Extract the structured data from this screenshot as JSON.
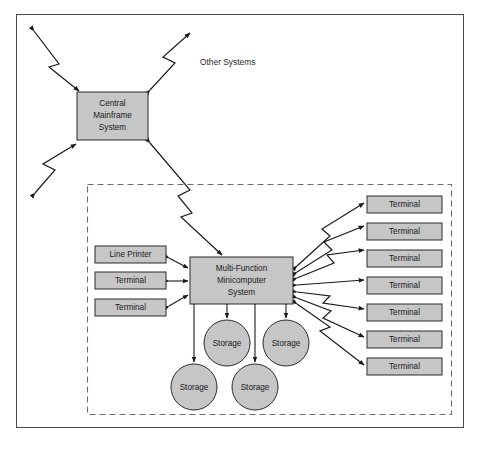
{
  "diagram": {
    "canvas": {
      "width": 479,
      "height": 450
    },
    "colors": {
      "node_fill": "#c6c6c6",
      "node_stroke": "#2b2b2b",
      "frame_stroke": "#4a4a4a",
      "dashed_stroke": "#6b6b6b",
      "link_stroke": "#1a1a1a",
      "background": "#ffffff",
      "text": "#1a1a1a"
    },
    "free_labels": [
      {
        "id": "other-systems",
        "text": "Other Systems",
        "x": 200,
        "y": 63
      }
    ],
    "nodes": {
      "mainframe": {
        "id": "central-mainframe-system",
        "shape": "rect",
        "label_lines": [
          "Central",
          "Mainframe",
          "System"
        ],
        "x": 77,
        "y": 92,
        "w": 71,
        "h": 48
      },
      "minicomputer": {
        "id": "multi-function-minicomputer-system",
        "shape": "rect",
        "label_lines": [
          "Multi-Function",
          "Minicomputer",
          "System"
        ],
        "x": 190,
        "y": 257,
        "w": 103,
        "h": 47
      },
      "left_devices": [
        {
          "id": "line-printer",
          "label": "Line Printer",
          "x": 95,
          "y": 246,
          "w": 71,
          "h": 17
        },
        {
          "id": "terminal-left-1",
          "label": "Terminal",
          "x": 95,
          "y": 272,
          "w": 71,
          "h": 17
        },
        {
          "id": "terminal-left-2",
          "label": "Terminal",
          "x": 95,
          "y": 299,
          "w": 71,
          "h": 17
        }
      ],
      "right_terminals": [
        {
          "id": "terminal-right-1",
          "label": "Terminal",
          "x": 367,
          "y": 196,
          "w": 75,
          "h": 17
        },
        {
          "id": "terminal-right-2",
          "label": "Terminal",
          "x": 367,
          "y": 223,
          "w": 75,
          "h": 17
        },
        {
          "id": "terminal-right-3",
          "label": "Terminal",
          "x": 367,
          "y": 250,
          "w": 75,
          "h": 17
        },
        {
          "id": "terminal-right-4",
          "label": "Terminal",
          "x": 367,
          "y": 277,
          "w": 75,
          "h": 17
        },
        {
          "id": "terminal-right-5",
          "label": "Terminal",
          "x": 367,
          "y": 304,
          "w": 75,
          "h": 17
        },
        {
          "id": "terminal-right-6",
          "label": "Terminal",
          "x": 367,
          "y": 331,
          "w": 75,
          "h": 17
        },
        {
          "id": "terminal-right-7",
          "label": "Terminal",
          "x": 367,
          "y": 358,
          "w": 75,
          "h": 17
        }
      ],
      "storage_units": [
        {
          "id": "storage-1",
          "label": "Storage",
          "cx": 227,
          "cy": 343,
          "r": 23
        },
        {
          "id": "storage-2",
          "label": "Storage",
          "cx": 286,
          "cy": 343,
          "r": 23
        },
        {
          "id": "storage-3",
          "label": "Storage",
          "cx": 194,
          "cy": 387,
          "r": 23
        },
        {
          "id": "storage-4",
          "label": "Storage",
          "cx": 255,
          "cy": 387,
          "r": 23
        }
      ]
    },
    "frames": {
      "outer": {
        "x": 16,
        "y": 14,
        "w": 448,
        "h": 414
      },
      "local_site_boundary": {
        "x": 87,
        "y": 184,
        "w": 365,
        "h": 231
      }
    }
  }
}
